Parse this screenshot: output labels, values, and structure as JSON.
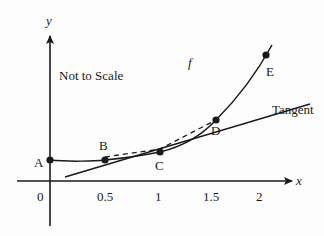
{
  "diagram": {
    "annotation": "Not to Scale",
    "function_label": "f",
    "tangent_label": "Tangent",
    "axes": {
      "x_label": "x",
      "y_label": "y",
      "x_ticks": [
        "0",
        "0.5",
        "1",
        "1.5",
        "2"
      ]
    },
    "points": [
      {
        "label": "A",
        "x": 0
      },
      {
        "label": "B",
        "x": 0.5
      },
      {
        "label": "C",
        "x": 1
      },
      {
        "label": "D",
        "x": 1.5
      },
      {
        "label": "E",
        "x": 2
      }
    ],
    "colors": {
      "ink": "#1a1a1a",
      "background": "#fdfdfd"
    }
  }
}
